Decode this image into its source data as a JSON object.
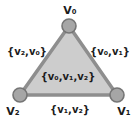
{
  "diagram": {
    "type": "simplicial-complex-triangle",
    "vertex_labels": {
      "v0": "V₀",
      "v1": "V₁",
      "v2": "V₂"
    },
    "edge_labels": {
      "left": "{v₂,v₀}",
      "right": "{v₀,v₁}",
      "bottom": "{v₁,v₂}"
    },
    "face_label": "{v₀,v₁,v₂}",
    "colors": {
      "background": "#ffffff",
      "face_fill": "#cdcdcd",
      "edge_stroke": "#8e8e8e",
      "vertex_fill": "#a6a6a6",
      "vertex_stroke": "#757575",
      "text": "#1b1b1b"
    }
  }
}
